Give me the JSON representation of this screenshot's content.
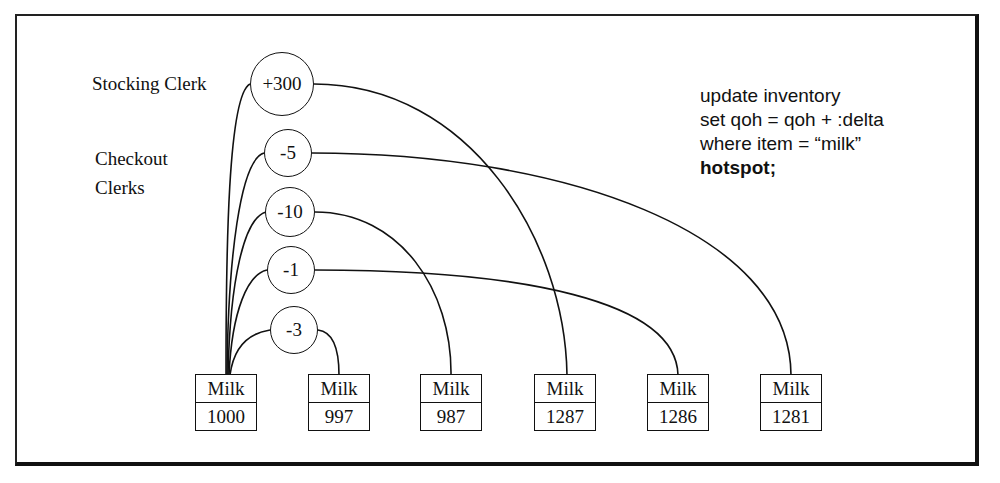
{
  "diagram": {
    "roles": {
      "stocking": "Stocking Clerk",
      "checkout_line1": "Checkout",
      "checkout_line2": "Clerks"
    },
    "sql": {
      "line1": "update inventory",
      "line2": "set qoh = qoh + :delta",
      "line3": "where item = “milk”",
      "line4": "hotspot;"
    },
    "transactions": [
      {
        "delta": "+300",
        "role": "stocking",
        "result_index": 3
      },
      {
        "delta": "-5",
        "role": "checkout",
        "result_index": 5
      },
      {
        "delta": "-10",
        "role": "checkout",
        "result_index": 2
      },
      {
        "delta": "-1",
        "role": "checkout",
        "result_index": 4
      },
      {
        "delta": "-3",
        "role": "checkout",
        "result_index": 1
      }
    ],
    "records": [
      {
        "item": "Milk",
        "qoh": "1000"
      },
      {
        "item": "Milk",
        "qoh": "997"
      },
      {
        "item": "Milk",
        "qoh": "987"
      },
      {
        "item": "Milk",
        "qoh": "1287"
      },
      {
        "item": "Milk",
        "qoh": "1286"
      },
      {
        "item": "Milk",
        "qoh": "1281"
      }
    ],
    "colors": {
      "ink": "#111111",
      "background": "#ffffff"
    }
  }
}
